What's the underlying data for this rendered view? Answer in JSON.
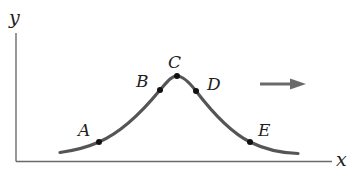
{
  "diagram": {
    "axes": {
      "x_label": "x",
      "y_label": "y"
    },
    "curve": {
      "description": "symmetric bell-shaped pulse",
      "color": "#555555"
    },
    "points": [
      {
        "id": "A",
        "label": "A"
      },
      {
        "id": "B",
        "label": "B"
      },
      {
        "id": "C",
        "label": "C"
      },
      {
        "id": "D",
        "label": "D"
      },
      {
        "id": "E",
        "label": "E"
      }
    ],
    "direction_arrow": {
      "direction": "right",
      "color": "#6a6a6a"
    }
  }
}
